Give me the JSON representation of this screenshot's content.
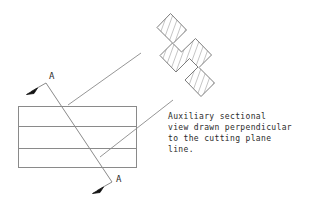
{
  "drawing": {
    "title": "Auxiliary Section View Illustration",
    "background_color": "#ffffff",
    "line_color": "#8a8a8a",
    "hatch_color": "#7d7d7d",
    "text_color": "#2b2b2b",
    "arrow_color": "#111111"
  },
  "note": {
    "lines": [
      "Auxiliary sectional",
      "view drawn perpendicular",
      "to the cutting plane",
      "line."
    ],
    "full_text": "Auxiliary sectional view drawn perpendicular to the cutting plane line."
  },
  "labels": {
    "cut_top": "A",
    "cut_bottom": "A"
  },
  "front_view": {
    "name": "front-view-rectangle",
    "x": 18,
    "y": 106,
    "width": 119,
    "height": 62,
    "interior_lines_y": [
      126,
      148
    ]
  },
  "cutting_plane": {
    "name": "cutting-plane-line",
    "vertex_top": [
      46,
      83
    ],
    "vertex_bottom": [
      112,
      182
    ],
    "arrow_top_tip": [
      28,
      93
    ],
    "arrow_bottom_tip": [
      94,
      192
    ]
  },
  "leaders": [
    {
      "name": "leader-upper",
      "from": [
        68,
        105
      ],
      "to": [
        141,
        53
      ]
    },
    {
      "name": "leader-lower",
      "from": [
        100,
        157
      ],
      "to": [
        173,
        100
      ]
    }
  ],
  "auxiliary_view": {
    "name": "auxiliary-section-ibeam",
    "description": "I-beam cross section rotated about 45 degrees, section-hatched",
    "hatch_spacing_px": 4,
    "hatch_angle_deg": 20
  }
}
